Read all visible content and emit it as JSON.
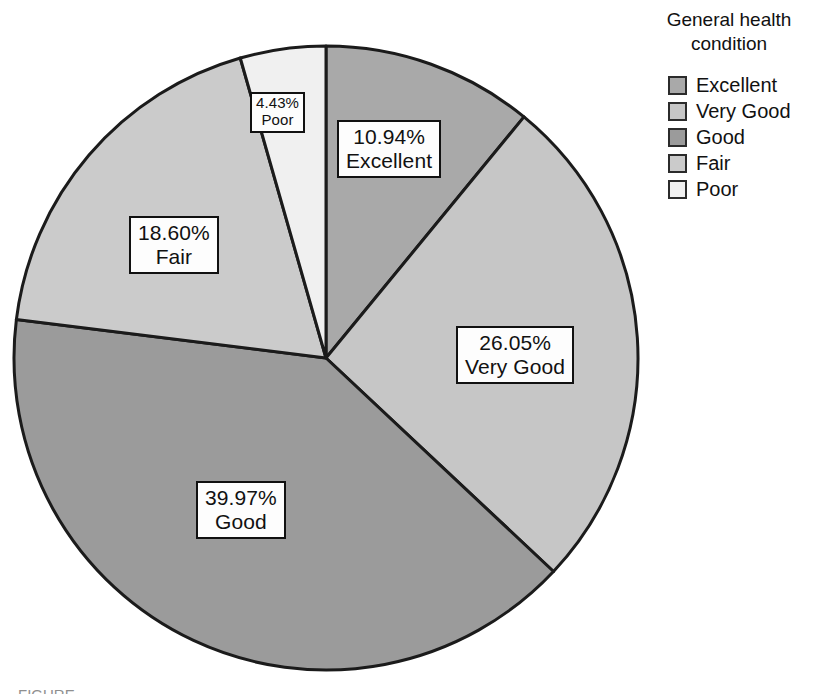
{
  "legend": {
    "title": "General health condition",
    "title_line1": "General health",
    "title_line2": "condition",
    "items": [
      {
        "label": "Excellent",
        "color": "#a9a9a9"
      },
      {
        "label": "Very Good",
        "color": "#c6c6c6"
      },
      {
        "label": "Good",
        "color": "#9b9b9b"
      },
      {
        "label": "Fair",
        "color": "#cbcbcb"
      },
      {
        "label": "Poor",
        "color": "#f0f0f0"
      }
    ]
  },
  "labels": {
    "excellent": {
      "pct": "10.94%",
      "cat": "Excellent"
    },
    "very_good": {
      "pct": "26.05%",
      "cat": "Very Good"
    },
    "good": {
      "pct": "39.97%",
      "cat": "Good"
    },
    "fair": {
      "pct": "18.60%",
      "cat": "Fair"
    },
    "poor": {
      "pct": "4.43%",
      "cat": "Poor"
    }
  },
  "caption": {
    "sliver": "FIGURE"
  },
  "chart_data": {
    "type": "pie",
    "title": "",
    "legend_title": "General health condition",
    "legend_position": "top-right",
    "grid": false,
    "start_angle_deg": 0,
    "direction": "clockwise",
    "center_px": [
      326,
      358
    ],
    "radius_px": 312,
    "slice_border_color": "#1b1b1b",
    "categories": [
      "Excellent",
      "Very Good",
      "Good",
      "Fair",
      "Poor"
    ],
    "values": [
      10.94,
      26.05,
      39.97,
      18.6,
      4.43
    ],
    "value_unit": "percent",
    "data_labels": [
      "10.94%",
      "26.05%",
      "39.97%",
      "18.60%",
      "4.43%"
    ],
    "colors": [
      "#a9a9a9",
      "#c6c6c6",
      "#9b9b9b",
      "#cbcbcb",
      "#f0f0f0"
    ],
    "total": 99.99
  }
}
